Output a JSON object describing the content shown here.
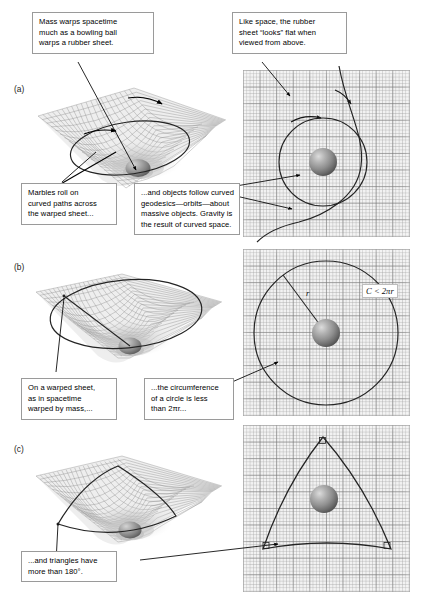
{
  "figure": {
    "background": "#ffffff",
    "panel_labels": [
      {
        "id": "a",
        "text": "(a)"
      },
      {
        "id": "b",
        "text": "(b)"
      },
      {
        "id": "c",
        "text": "(c)"
      }
    ]
  },
  "callouts": [
    {
      "id": "mass-warps-spacetime",
      "lines": [
        "Mass warps spacetime",
        "much as a bowling ball",
        "warps a rubber sheet."
      ]
    },
    {
      "id": "looks-flat-from-above",
      "lines": [
        "Like space, the rubber",
        "sheet “looks” flat when",
        "viewed from above."
      ]
    },
    {
      "id": "marbles-roll",
      "lines": [
        "Marbles roll on",
        "curved paths across",
        "the warped sheet..."
      ]
    },
    {
      "id": "curved-geodesics",
      "lines": [
        "...and objects follow curved",
        "geodesics—orbits—about",
        "massive objects. Gravity is",
        "the result of curved space."
      ]
    },
    {
      "id": "on-a-warped-sheet",
      "lines": [
        "On a warped sheet,",
        "as in spacetime",
        "warped by mass,..."
      ]
    },
    {
      "id": "circumference-less",
      "lines": [
        "...the circumference",
        "of a circle is less",
        "than 2πr..."
      ]
    },
    {
      "id": "triangles-more-than-180",
      "lines": [
        "...and triangles have",
        "more than 180°."
      ]
    }
  ],
  "annotations": {
    "radius_label": "r",
    "circumference_inequality": "C < 2πr"
  },
  "colors": {
    "callout_border": "#9a9a9a",
    "callout_background": "#ffffff",
    "grid_fill": "#f2f2f2",
    "grid_line_major": "#787878",
    "grid_line_minor": "#a5a5a5",
    "curve_stroke": "#262626",
    "leader_line": "#000000",
    "sphere_highlight": "#d8d8d8",
    "sphere_midtone": "#8e8e8e",
    "sphere_shadow": "#4a4a4a",
    "mesh_line": "#8c8c8c",
    "text": "#000000"
  },
  "geometry": {
    "panel_a_grid": {
      "x": 243,
      "y": 70,
      "w": 167,
      "h": 167
    },
    "panel_b_grid": {
      "x": 243,
      "y": 249,
      "w": 167,
      "h": 167
    },
    "panel_c_grid": {
      "x": 243,
      "y": 425,
      "w": 167,
      "h": 167
    }
  }
}
